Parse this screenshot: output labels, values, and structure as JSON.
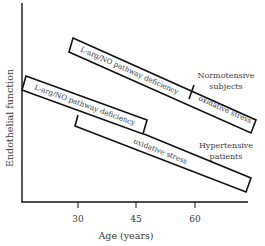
{
  "diagram": {
    "y_axis_label": "Endothelial function",
    "x_axis_label": "Age (years)",
    "x_ticks": [
      "30",
      "45",
      "60"
    ],
    "groups": [
      {
        "name": "Normotensive subjects",
        "label_line1": "Normotensive",
        "label_line2": "subjects",
        "segments": [
          {
            "label": "L-arg/NO pathway deficiency"
          },
          {
            "label": "oxidative stress"
          }
        ]
      },
      {
        "name": "Hypertensive patients",
        "label_line1": "Hypertensive",
        "label_line2": "patients",
        "segments": [
          {
            "label": "L-arg/NO pathway deficiency"
          },
          {
            "label": "oxidative stress"
          }
        ]
      }
    ]
  },
  "colors": {
    "line": "#111111",
    "text": "#3a3a3a",
    "background": "#ffffff"
  }
}
